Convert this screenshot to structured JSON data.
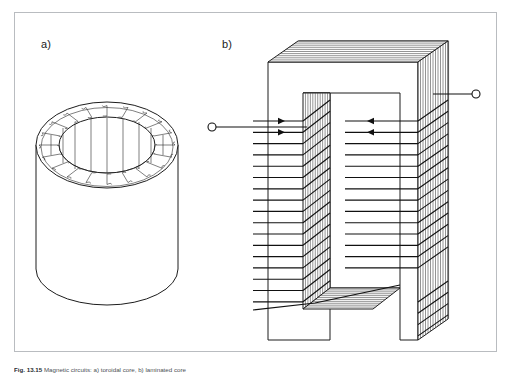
{
  "figure": {
    "panels": [
      {
        "id": "a",
        "label": "a)",
        "name": "toroidal-core-panel",
        "description": "Cylindrical (toroidal) magnetic core shown in perspective with a uniformly distributed toroidal winding wrapped around the annular rim and axial flux lines through the bore."
      },
      {
        "id": "b",
        "label": "b)",
        "name": "laminated-core-panel",
        "description": "Laminated C-shaped magnetic core drawn in three-dimensional perspective showing the stacked sheet laminations, with the coil turns wound around both limbs and two external terminals."
      }
    ],
    "caption": {
      "number": "Fig. 13.15",
      "text": "Magnetic circuits: a) toroidal core, b) laminated core"
    },
    "colors": {
      "frame_border": "#b9bcc0",
      "line": "#1d1d1d",
      "lamination_line": "#3a3a3a",
      "wire": "#111111",
      "background": "#ffffff",
      "label_text": "#1b1b1b",
      "caption_text": "#4c4f54"
    },
    "geometry": {
      "toroid": {
        "center_x": 107,
        "top_ellipse_cy": 145,
        "outer_rx": 71,
        "outer_ry": 43,
        "inner_rx": 48,
        "inner_ry": 28,
        "body_bottom_y": 296,
        "winding_turns": 20,
        "flux_lines": 9
      },
      "laminated_core": {
        "front_left_x": 268,
        "front_top_y": 62,
        "front_bottom_y": 340,
        "window_top_y": 93,
        "window_left_x": 330,
        "window_right_x": 400,
        "window_bottom_y": 288,
        "lamination_sheets": 9,
        "left_limb_turns": 17,
        "right_limb_turns": 14
      },
      "terminals": [
        {
          "name": "left-terminal",
          "cx": 212,
          "cy": 127,
          "r": 4
        },
        {
          "name": "right-terminal",
          "cx": 476,
          "cy": 94,
          "r": 4
        }
      ]
    }
  }
}
